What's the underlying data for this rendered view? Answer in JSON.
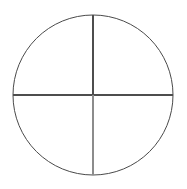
{
  "figure": {
    "background_color": "#ffffff",
    "canvas": {
      "width": 187,
      "height": 189
    },
    "shapes": {
      "circle": {
        "name": "outline-circle",
        "center_x": 93,
        "center_y": 95,
        "radius": 80,
        "stroke_color": "#4a4a4a",
        "stroke_width": 1,
        "fill": "none"
      },
      "horizontal_diameter": {
        "name": "horizontal-diameter-line",
        "x1": 13,
        "y1": 95,
        "x2": 173,
        "y2": 95,
        "stroke_color": "#4d4d4d",
        "stroke_width": 1.2
      },
      "vertical_diameter_upper": {
        "name": "vertical-diameter-upper-segment",
        "x1": 93,
        "y1": 15,
        "x2": 93,
        "y2": 95,
        "stroke_color": "#4d4d4d",
        "stroke_width": 1.2
      },
      "vertical_diameter_lower": {
        "name": "vertical-diameter-lower-segment",
        "x1": 93,
        "y1": 95,
        "x2": 93,
        "y2": 175,
        "stroke_color": "#8c8c8c",
        "stroke_width": 1.2
      }
    },
    "quadrant_labels": {
      "top_left": "",
      "top_right": "",
      "bottom_left": "",
      "bottom_right": ""
    }
  }
}
